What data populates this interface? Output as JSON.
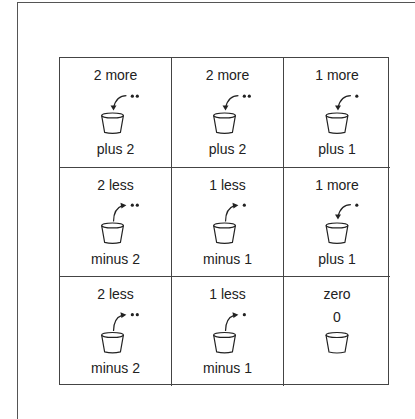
{
  "diagram": {
    "cells": [
      {
        "top": "2 more",
        "bottom": "plus 2",
        "action": "add",
        "dots": 2,
        "icon": "bucket-in-arrow-icon"
      },
      {
        "top": "2 more",
        "bottom": "plus 2",
        "action": "add",
        "dots": 2,
        "icon": "bucket-in-arrow-icon"
      },
      {
        "top": "1 more",
        "bottom": "plus 1",
        "action": "add",
        "dots": 1,
        "icon": "bucket-in-arrow-icon"
      },
      {
        "top": "2 less",
        "bottom": "minus 2",
        "action": "remove",
        "dots": 2,
        "icon": "bucket-out-arrow-icon"
      },
      {
        "top": "1 less",
        "bottom": "minus 1",
        "action": "remove",
        "dots": 1,
        "icon": "bucket-out-arrow-icon"
      },
      {
        "top": "1 more",
        "bottom": "plus 1",
        "action": "add",
        "dots": 1,
        "icon": "bucket-in-arrow-icon"
      },
      {
        "top": "2 less",
        "bottom": "minus 2",
        "action": "remove",
        "dots": 2,
        "icon": "bucket-out-arrow-icon"
      },
      {
        "top": "1 less",
        "bottom": "minus 1",
        "action": "remove",
        "dots": 1,
        "icon": "bucket-out-arrow-icon"
      },
      {
        "top": "zero",
        "middle": "0",
        "action": "none",
        "dots": 0,
        "icon": "bucket-icon"
      }
    ]
  },
  "colors": {
    "line": "#444444",
    "text": "#222222",
    "background": "#ffffff"
  }
}
